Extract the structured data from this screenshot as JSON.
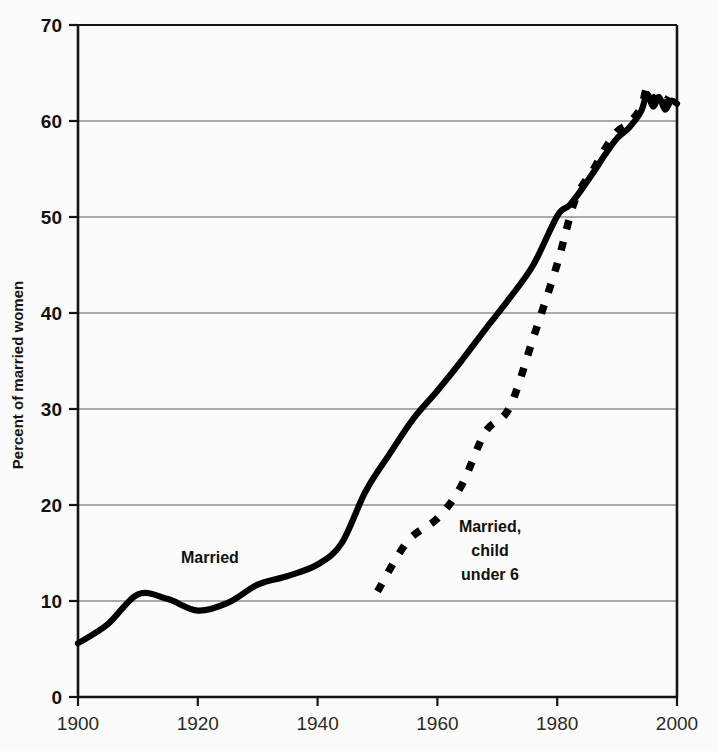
{
  "chart_data": {
    "type": "line",
    "title": "",
    "subtitle": "",
    "xlabel": "",
    "ylabel": "Percent of married women",
    "xlim": [
      1900,
      2000
    ],
    "ylim": [
      0,
      70
    ],
    "xticks": [
      "1900",
      "1920",
      "1940",
      "1960",
      "1980",
      "2000"
    ],
    "yticks": [
      "0",
      "10",
      "20",
      "30",
      "40",
      "50",
      "60",
      "70"
    ],
    "grid": "horizontal",
    "legend_position": "inline-annotations",
    "line_color": "#000000",
    "grid_color": "#8f8f8f",
    "axis_color": "#151515",
    "background_color": "#fbfbfb",
    "annotations": [
      {
        "name": "married-label",
        "text": "Married",
        "x": 1917,
        "y": 15.5
      },
      {
        "name": "married-child-label",
        "line1": "Married,",
        "line2": "child",
        "line3": "under 6",
        "x": 1968,
        "y": 18.5
      }
    ],
    "series": [
      {
        "name": "Married",
        "label": "Married",
        "style": "solid",
        "x": [
          1900,
          1905,
          1910,
          1915,
          1920,
          1925,
          1930,
          1935,
          1940,
          1944,
          1948,
          1952,
          1956,
          1960,
          1964,
          1968,
          1972,
          1976,
          1980,
          1982,
          1984,
          1986,
          1988,
          1990,
          1992,
          1994,
          1995,
          1996,
          1997,
          1998,
          1999,
          2000
        ],
        "y": [
          5.6,
          7.6,
          10.7,
          10.2,
          9.0,
          9.8,
          11.7,
          12.6,
          13.8,
          16.0,
          21.4,
          25.3,
          29.0,
          31.9,
          35.0,
          38.3,
          41.5,
          45.0,
          50.1,
          51.2,
          52.8,
          54.6,
          56.5,
          58.2,
          59.3,
          61.0,
          62.8,
          61.5,
          62.5,
          61.2,
          62.1,
          61.8
        ]
      },
      {
        "name": "Married, child under 6",
        "label": "Married, child under 6",
        "style": "dashed",
        "x": [
          1950,
          1955,
          1960,
          1964,
          1968,
          1972,
          1976,
          1980,
          1983,
          1986,
          1988,
          1990,
          1992,
          1994,
          1995,
          1996,
          1997,
          1998,
          1999,
          2000
        ],
        "y": [
          11.0,
          16.2,
          18.6,
          22.0,
          27.6,
          30.1,
          37.4,
          45.1,
          51.8,
          54.9,
          57.1,
          58.9,
          59.8,
          61.4,
          63.5,
          62.3,
          63.0,
          62.0,
          62.8,
          63.2
        ]
      }
    ]
  },
  "axes": {
    "ylabel": "Percent of married women",
    "xlabel": ""
  }
}
